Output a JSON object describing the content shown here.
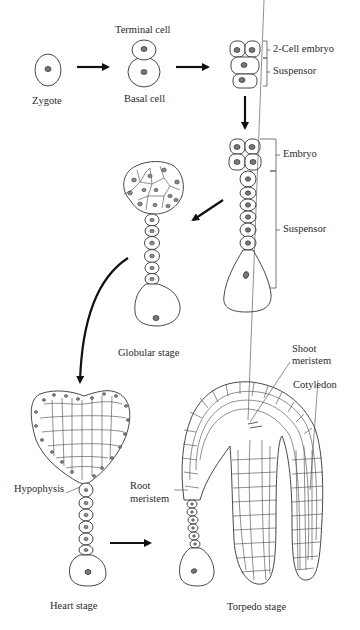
{
  "figure": {
    "stages": [
      {
        "id": "zygote",
        "label": "Zygote"
      },
      {
        "id": "two-cell",
        "labels": {
          "top": "Terminal cell",
          "bottom": "Basal cell"
        }
      },
      {
        "id": "four-cell",
        "labels": {
          "embryo": "2-Cell embryo",
          "suspensor": "Suspensor"
        }
      },
      {
        "id": "octant",
        "labels": {
          "embryo": "Embryo",
          "suspensor": "Suspensor"
        }
      },
      {
        "id": "globular",
        "label": "Globular stage"
      },
      {
        "id": "heart",
        "label": "Heart stage",
        "annotations": {
          "hypophysis": "Hypophysis"
        }
      },
      {
        "id": "torpedo",
        "label": "Torpedo stage",
        "annotations": {
          "shoot_meristem_line1": "Shoot",
          "shoot_meristem_line2": "meristem",
          "cotyledon": "Cotyledon",
          "root_meristem_line1": "Root",
          "root_meristem_line2": "meristem"
        }
      }
    ],
    "arrows": [
      {
        "from": "zygote",
        "to": "two-cell"
      },
      {
        "from": "two-cell",
        "to": "four-cell"
      },
      {
        "from": "four-cell",
        "to": "octant"
      },
      {
        "from": "octant",
        "to": "globular"
      },
      {
        "from": "globular",
        "to": "heart"
      },
      {
        "from": "heart",
        "to": "torpedo"
      }
    ]
  }
}
